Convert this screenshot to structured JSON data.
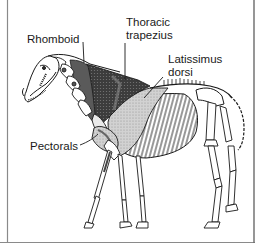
{
  "figure": {
    "labels": [
      {
        "id": "rhomboid",
        "text": "Rhomboid"
      },
      {
        "id": "thoracic_trapezius_line1",
        "text": "Thoracic"
      },
      {
        "id": "thoracic_trapezius_line2",
        "text": "trapezius"
      },
      {
        "id": "latissimus_line1",
        "text": "Latissimus"
      },
      {
        "id": "latissimus_line2",
        "text": "dorsi"
      },
      {
        "id": "pectorals",
        "text": "Pectorals"
      }
    ],
    "colors": {
      "line": "#1a1a1a",
      "trapezius_dark": "#3a3a3a",
      "rhomboid_mid": "#555555",
      "latissimus_light": "#c8c8c8",
      "pectoral": "#b0b0b0",
      "frame": "#7a7a7a",
      "background": "#ffffff"
    }
  }
}
